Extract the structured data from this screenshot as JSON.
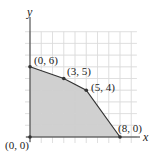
{
  "chart_data": {
    "type": "area",
    "title": "",
    "xlabel": "x",
    "ylabel": "y",
    "xlim": [
      0,
      9.5
    ],
    "ylim": [
      0,
      9
    ],
    "grid": true,
    "region_vertices": [
      [
        0,
        0
      ],
      [
        0,
        6
      ],
      [
        3,
        5
      ],
      [
        5,
        4
      ],
      [
        8,
        0
      ]
    ],
    "points": [
      {
        "x": 0,
        "y": 0,
        "label": "(0, 0)"
      },
      {
        "x": 0,
        "y": 6,
        "label": "(0, 6)"
      },
      {
        "x": 3,
        "y": 5,
        "label": "(3, 5)"
      },
      {
        "x": 5,
        "y": 4,
        "label": "(5, 4)"
      },
      {
        "x": 8,
        "y": 0,
        "label": "(8, 0)"
      }
    ],
    "colors": {
      "fill": "#c8c8c8",
      "grid": "#dcdcdc",
      "line": "#333333"
    }
  },
  "axes": {
    "x_label": "x",
    "y_label": "y"
  },
  "labels": {
    "p00": "(0, 0)",
    "p06": "(0, 6)",
    "p35": "(3, 5)",
    "p54": "(5, 4)",
    "p80": "(8, 0)"
  }
}
